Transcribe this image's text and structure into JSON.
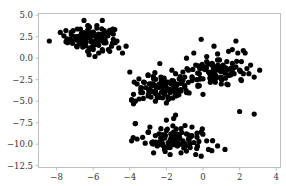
{
  "chart_data": {
    "type": "scatter",
    "title": "",
    "xlabel": "",
    "ylabel": "",
    "xlim": [
      -9,
      4.2
    ],
    "ylim": [
      -12.5,
      5.2
    ],
    "grid": false,
    "legend": null,
    "marker_color": "#000000",
    "x_ticks": [
      -8,
      -6,
      -4,
      -2,
      0,
      2,
      4
    ],
    "x_tick_labels": [
      "−8",
      "−6",
      "−4",
      "−2",
      "0",
      "2",
      "4"
    ],
    "y_ticks": [
      5.0,
      2.5,
      0.0,
      -2.5,
      -5.0,
      -7.5,
      -10.0,
      -12.5
    ],
    "y_tick_labels": [
      "5.0",
      "2.5",
      "0.0",
      "−2.5",
      "−5.0",
      "−7.5",
      "−10.0",
      "−12.5"
    ],
    "series": [
      {
        "name": "cluster-top-left",
        "center": [
          -6.0,
          2.3
        ],
        "spread": [
          0.85,
          0.85
        ],
        "n": 110,
        "x": [
          -8.4,
          -7.8,
          -7.6,
          -7.4,
          -7.2,
          -7.0,
          -6.9,
          -6.8,
          -6.7,
          -6.6,
          -6.5,
          -6.4,
          -6.3,
          -6.2,
          -6.1,
          -6.0,
          -5.9,
          -5.8,
          -5.7,
          -5.6,
          -5.5,
          -5.4,
          -5.3,
          -5.2,
          -5.1,
          -5.0,
          -4.9,
          -4.8,
          -4.6,
          -4.4,
          -4.2,
          -6.5,
          -6.2,
          -5.8,
          -5.5,
          -6.1,
          -5.7,
          -6.9,
          -7.1,
          -5.3,
          -4.9,
          -6.3,
          -6.0,
          -5.6,
          -5.9,
          -6.7,
          -7.3,
          -5.1,
          -4.7,
          -6.4
        ],
        "y": [
          2.0,
          3.0,
          2.6,
          1.8,
          3.0,
          2.5,
          1.4,
          2.0,
          3.4,
          2.8,
          1.6,
          2.2,
          3.8,
          1.2,
          2.6,
          3.0,
          2.0,
          3.5,
          0.6,
          2.4,
          1.0,
          3.2,
          1.8,
          2.6,
          0.8,
          1.4,
          2.8,
          1.8,
          1.2,
          0.6,
          1.4,
          4.4,
          3.6,
          3.8,
          4.4,
          2.0,
          1.5,
          2.2,
          3.2,
          2.9,
          2.2,
          0.8,
          1.0,
          2.0,
          0.2,
          2.6,
          2.2,
          3.0,
          2.0,
          1.8
        ]
      },
      {
        "name": "cluster-middle-left",
        "center": [
          -2.2,
          -3.6
        ],
        "spread": [
          0.8,
          0.9
        ],
        "n": 110,
        "x": [
          -3.8,
          -3.6,
          -3.4,
          -3.2,
          -3.0,
          -2.8,
          -2.7,
          -2.6,
          -2.5,
          -2.4,
          -2.3,
          -2.2,
          -2.1,
          -2.0,
          -1.9,
          -1.8,
          -1.7,
          -1.6,
          -1.5,
          -1.4,
          -1.3,
          -1.2,
          -1.1,
          -1.0,
          -0.9,
          -0.8,
          -3.9,
          -3.7,
          -3.5,
          -2.9,
          -2.6,
          -2.2,
          -1.9,
          -1.5,
          -1.1,
          -3.3,
          -2.4,
          -1.7,
          -3.0,
          -2.0
        ],
        "y": [
          -4.2,
          -3.0,
          -3.6,
          -2.8,
          -4.4,
          -3.2,
          -2.4,
          -3.8,
          -4.6,
          -3.0,
          -2.2,
          -3.4,
          -4.2,
          -2.8,
          -3.6,
          -4.0,
          -2.6,
          -3.2,
          -4.4,
          -3.0,
          -2.4,
          -3.8,
          -2.6,
          -3.2,
          -4.0,
          -2.8,
          -4.8,
          -5.0,
          -2.4,
          -3.6,
          -5.0,
          -4.6,
          -4.8,
          -1.8,
          -1.6,
          -4.0,
          -3.4,
          -1.4,
          -2.0,
          -5.2
        ]
      },
      {
        "name": "cluster-middle-right",
        "center": [
          0.6,
          -1.5
        ],
        "spread": [
          1.0,
          0.9
        ],
        "n": 110,
        "x": [
          -1.0,
          -0.8,
          -0.6,
          -0.4,
          -0.2,
          0.0,
          0.1,
          0.2,
          0.3,
          0.4,
          0.5,
          0.6,
          0.7,
          0.8,
          0.9,
          1.0,
          1.1,
          1.2,
          1.3,
          1.4,
          1.5,
          1.6,
          1.7,
          1.8,
          1.9,
          2.0,
          2.1,
          2.2,
          2.4,
          2.6,
          2.8,
          3.1,
          -0.5,
          0.2,
          0.6,
          1.0,
          1.4,
          1.8,
          2.3,
          -0.2,
          0.4,
          0.9,
          1.6,
          2.1,
          -0.9,
          1.3,
          0.0,
          -0.1
        ],
        "y": [
          -2.2,
          -1.4,
          -2.6,
          -0.8,
          -1.8,
          -2.4,
          -1.0,
          -0.4,
          -1.6,
          -2.2,
          -0.6,
          -1.2,
          -2.0,
          -0.2,
          -1.4,
          -2.4,
          -0.8,
          -1.6,
          -0.4,
          -2.0,
          -1.2,
          -0.6,
          -1.8,
          -1.0,
          0.6,
          -1.4,
          -0.4,
          -1.8,
          -1.2,
          -0.8,
          -2.2,
          -1.4,
          0.6,
          0.2,
          1.4,
          -3.0,
          0.8,
          2.0,
          0.6,
          -3.2,
          -2.8,
          -0.2,
          1.0,
          -2.6,
          0.0,
          -3.0,
          -4.2,
          2.2
        ]
      },
      {
        "name": "cluster-bottom",
        "center": [
          -1.6,
          -9.4
        ],
        "spread": [
          0.9,
          0.8
        ],
        "n": 110,
        "x": [
          -3.9,
          -3.6,
          -3.3,
          -3.0,
          -2.8,
          -2.6,
          -2.5,
          -2.4,
          -2.3,
          -2.2,
          -2.1,
          -2.0,
          -1.9,
          -1.8,
          -1.7,
          -1.6,
          -1.5,
          -1.4,
          -1.3,
          -1.2,
          -1.1,
          -1.0,
          -0.9,
          -0.8,
          -0.7,
          -0.6,
          -0.5,
          -0.3,
          -0.1,
          0.2,
          0.8,
          -3.7,
          -2.9,
          -2.0,
          -1.5,
          -1.2,
          -0.9,
          -0.4,
          -0.1,
          0.3,
          -1.8,
          -2.7,
          -0.6,
          -1.6,
          -2.3,
          1.2,
          -2.1
        ],
        "y": [
          -9.6,
          -9.4,
          -9.2,
          -8.6,
          -9.8,
          -9.0,
          -10.2,
          -8.8,
          -9.6,
          -10.0,
          -9.2,
          -8.4,
          -9.8,
          -10.4,
          -9.0,
          -8.6,
          -9.4,
          -10.2,
          -9.0,
          -8.2,
          -9.6,
          -10.0,
          -8.8,
          -9.4,
          -10.4,
          -9.0,
          -9.8,
          -10.2,
          -8.6,
          -9.6,
          -10.2,
          -7.6,
          -8.0,
          -7.2,
          -6.6,
          -11.0,
          -10.8,
          -11.2,
          -11.4,
          -10.6,
          -11.2,
          -11.0,
          -8.0,
          -7.0,
          -8.2,
          -10.6,
          -10.6
        ]
      },
      {
        "name": "outliers",
        "n": 10,
        "x": [
          2.0,
          2.8,
          -4.0,
          -3.9,
          -3.4,
          -3.8,
          -3.7,
          -5.2,
          2.2,
          0.8
        ],
        "y": [
          -6.2,
          -6.5,
          -1.6,
          -4.9,
          -4.0,
          -5.3,
          -7.6,
          2.7,
          0.9,
          0.5
        ]
      }
    ]
  }
}
